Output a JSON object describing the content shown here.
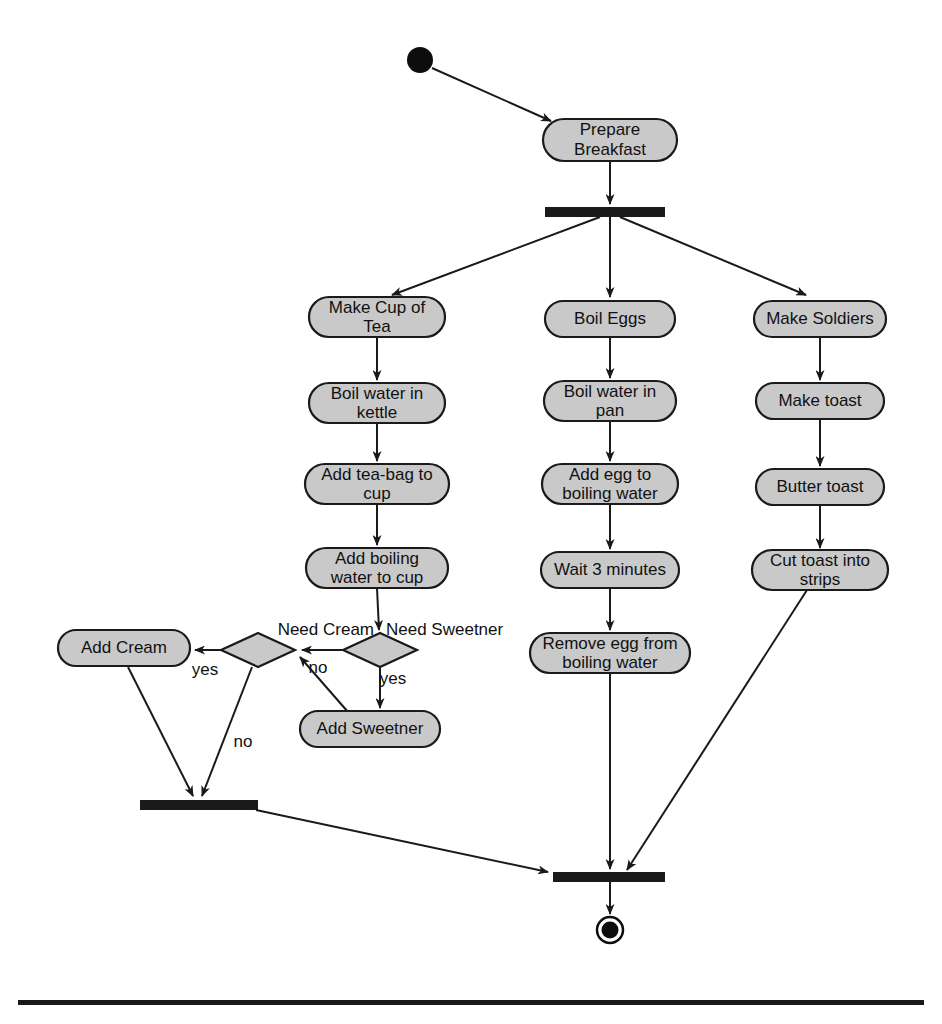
{
  "diagram": {
    "type": "uml-activity-diagram",
    "colors": {
      "node_fill": "#c9c9c9",
      "node_stroke": "#1a1a1a",
      "bar": "#1a1a1a",
      "background": "#ffffff",
      "text": "#111111"
    },
    "initial_node": {
      "name": "start",
      "cx": 420,
      "cy": 60,
      "r": 13
    },
    "final_node": {
      "name": "end",
      "cx": 610,
      "cy": 930,
      "r_outer": 13,
      "r_inner": 8
    },
    "bars": [
      {
        "name": "fork-bar-main",
        "x": 545,
        "y": 207,
        "w": 120,
        "h": 10
      },
      {
        "name": "join-bar-tea",
        "x": 140,
        "y": 800,
        "w": 118,
        "h": 10
      },
      {
        "name": "join-bar-final",
        "x": 553,
        "y": 872,
        "w": 112,
        "h": 10
      }
    ],
    "activities": [
      {
        "id": "prepare_breakfast",
        "label": "Prepare Breakfast",
        "lines": [
          "Prepare",
          "Breakfast"
        ],
        "cx": 610,
        "cy": 140,
        "w": 134,
        "h": 42
      },
      {
        "id": "make_cup_of_tea",
        "label": "Make Cup of Tea",
        "lines": [
          "Make Cup of",
          "Tea"
        ],
        "cx": 377,
        "cy": 317,
        "w": 136,
        "h": 40
      },
      {
        "id": "boil_water_kettle",
        "label": "Boil water in kettle",
        "lines": [
          "Boil water in",
          "kettle"
        ],
        "cx": 377,
        "cy": 403,
        "w": 136,
        "h": 40
      },
      {
        "id": "add_tea_bag",
        "label": "Add tea-bag to cup",
        "lines": [
          "Add tea-bag to",
          "cup"
        ],
        "cx": 377,
        "cy": 484,
        "w": 144,
        "h": 40
      },
      {
        "id": "add_boiling_water",
        "label": "Add boiling water to cup",
        "lines": [
          "Add boiling",
          "water to cup"
        ],
        "cx": 377,
        "cy": 568,
        "w": 142,
        "h": 40
      },
      {
        "id": "boil_eggs",
        "label": "Boil Eggs",
        "lines": [
          "Boil Eggs"
        ],
        "cx": 610,
        "cy": 319,
        "w": 130,
        "h": 36
      },
      {
        "id": "boil_water_pan",
        "label": "Boil water in pan",
        "lines": [
          "Boil water in",
          "pan"
        ],
        "cx": 610,
        "cy": 401,
        "w": 132,
        "h": 40
      },
      {
        "id": "add_egg_to_water",
        "label": "Add egg to boiling water",
        "lines": [
          "Add egg to",
          "boiling water"
        ],
        "cx": 610,
        "cy": 484,
        "w": 136,
        "h": 40
      },
      {
        "id": "wait_3_minutes",
        "label": "Wait 3 minutes",
        "lines": [
          "Wait 3 minutes"
        ],
        "cx": 610,
        "cy": 570,
        "w": 138,
        "h": 36
      },
      {
        "id": "remove_egg",
        "label": "Remove egg from boiling water",
        "lines": [
          "Remove egg from",
          "boiling water"
        ],
        "cx": 610,
        "cy": 653,
        "w": 160,
        "h": 40
      },
      {
        "id": "make_soldiers",
        "label": "Make Soldiers",
        "lines": [
          "Make Soldiers"
        ],
        "cx": 820,
        "cy": 319,
        "w": 132,
        "h": 36
      },
      {
        "id": "make_toast",
        "label": "Make toast",
        "lines": [
          "Make toast"
        ],
        "cx": 820,
        "cy": 401,
        "w": 128,
        "h": 36
      },
      {
        "id": "butter_toast",
        "label": "Butter toast",
        "lines": [
          "Butter toast"
        ],
        "cx": 820,
        "cy": 487,
        "w": 128,
        "h": 36
      },
      {
        "id": "cut_toast",
        "label": "Cut toast into strips",
        "lines": [
          "Cut toast into",
          "strips"
        ],
        "cx": 820,
        "cy": 570,
        "w": 136,
        "h": 40
      },
      {
        "id": "add_cream",
        "label": "Add Cream",
        "lines": [
          "Add Cream"
        ],
        "cx": 124,
        "cy": 648,
        "w": 132,
        "h": 36
      },
      {
        "id": "add_sweetner",
        "label": "Add Sweetner",
        "lines": [
          "Add Sweetner"
        ],
        "cx": 370,
        "cy": 729,
        "w": 140,
        "h": 36
      }
    ],
    "decisions": [
      {
        "id": "need_cream",
        "label": "Need Cream",
        "cx": 258,
        "cy": 650,
        "w": 74,
        "h": 34,
        "label_x": 255,
        "label_y": 630,
        "label_anchor": "end"
      },
      {
        "id": "need_sweetner",
        "label": "Need Sweetner",
        "cx": 380,
        "cy": 650,
        "w": 74,
        "h": 34,
        "label_x": 390,
        "label_y": 630,
        "label_anchor": "start"
      }
    ],
    "guards": [
      {
        "id": "guard_cream_yes",
        "label": "yes",
        "x": 205,
        "y": 668
      },
      {
        "id": "guard_sweetner_no",
        "label": "no",
        "x": 318,
        "y": 668
      },
      {
        "id": "guard_sweetner_yes",
        "label": "yes",
        "x": 391,
        "y": 678
      },
      {
        "id": "guard_cream_no",
        "label": "no",
        "x": 243,
        "y": 741
      }
    ],
    "edges": [
      {
        "from": "start",
        "to": "prepare_breakfast"
      },
      {
        "from": "prepare_breakfast",
        "to": "fork-bar-main"
      },
      {
        "from": "fork-bar-main",
        "to": "make_cup_of_tea"
      },
      {
        "from": "fork-bar-main",
        "to": "boil_eggs"
      },
      {
        "from": "fork-bar-main",
        "to": "make_soldiers"
      },
      {
        "from": "make_cup_of_tea",
        "to": "boil_water_kettle"
      },
      {
        "from": "boil_water_kettle",
        "to": "add_tea_bag"
      },
      {
        "from": "add_tea_bag",
        "to": "add_boiling_water"
      },
      {
        "from": "add_boiling_water",
        "to": "need_sweetner"
      },
      {
        "from": "need_sweetner",
        "to": "add_sweetner",
        "guard": "yes"
      },
      {
        "from": "need_sweetner",
        "to": "need_cream",
        "guard": "no"
      },
      {
        "from": "add_sweetner",
        "to": "need_cream"
      },
      {
        "from": "need_cream",
        "to": "add_cream",
        "guard": "yes"
      },
      {
        "from": "need_cream",
        "to": "join-bar-tea",
        "guard": "no"
      },
      {
        "from": "add_cream",
        "to": "join-bar-tea"
      },
      {
        "from": "join-bar-tea",
        "to": "join-bar-final"
      },
      {
        "from": "boil_eggs",
        "to": "boil_water_pan"
      },
      {
        "from": "boil_water_pan",
        "to": "add_egg_to_water"
      },
      {
        "from": "add_egg_to_water",
        "to": "wait_3_minutes"
      },
      {
        "from": "wait_3_minutes",
        "to": "remove_egg"
      },
      {
        "from": "remove_egg",
        "to": "join-bar-final"
      },
      {
        "from": "make_soldiers",
        "to": "make_toast"
      },
      {
        "from": "make_toast",
        "to": "butter_toast"
      },
      {
        "from": "butter_toast",
        "to": "cut_toast"
      },
      {
        "from": "cut_toast",
        "to": "join-bar-final"
      },
      {
        "from": "join-bar-final",
        "to": "end"
      }
    ],
    "footer_rule": {
      "name": "page-footer-rule",
      "x": 18,
      "y": 1000,
      "w": 906,
      "h": 5
    }
  }
}
